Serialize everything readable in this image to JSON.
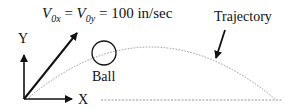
{
  "diagram": {
    "equation": {
      "v0x": "V",
      "v0x_sub": "0x",
      "eq1": " = ",
      "v0y": "V",
      "v0y_sub": "0y",
      "eq2": " = 100 in/sec"
    },
    "labels": {
      "y_axis": "Y",
      "x_axis": "X",
      "ball": "Ball",
      "trajectory": "Trajectory"
    },
    "colors": {
      "ink": "#111111",
      "trajectory": "#888888"
    }
  }
}
